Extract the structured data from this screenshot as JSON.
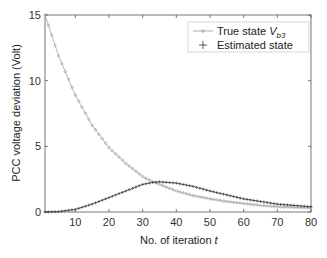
{
  "chart_data": {
    "type": "line",
    "title": "",
    "xlabel": "No. of iteration t",
    "ylabel": "PCC voltage deviation (Volt)",
    "xlim": [
      1,
      80
    ],
    "ylim": [
      0,
      15
    ],
    "xticks": [
      10,
      20,
      30,
      40,
      50,
      60,
      70,
      80
    ],
    "yticks": [
      0,
      5,
      10,
      15
    ],
    "grid": false,
    "legend_position": "upper right",
    "series": [
      {
        "name": "True state V_b3",
        "marker": "o",
        "color": "#9a9a9a",
        "x": [
          1,
          5,
          10,
          15,
          20,
          25,
          30,
          33,
          35,
          40,
          45,
          50,
          55,
          60,
          65,
          70,
          75,
          80
        ],
        "values": [
          15.0,
          11.9,
          8.9,
          6.6,
          4.9,
          3.7,
          2.7,
          2.3,
          2.1,
          1.6,
          1.25,
          1.0,
          0.8,
          0.65,
          0.5,
          0.4,
          0.35,
          0.3
        ]
      },
      {
        "name": "Estimated state",
        "marker": "+",
        "color": "#333333",
        "x": [
          1,
          5,
          10,
          15,
          20,
          25,
          30,
          33,
          35,
          40,
          45,
          50,
          55,
          60,
          65,
          70,
          75,
          80
        ],
        "values": [
          0.0,
          0.03,
          0.2,
          0.6,
          1.1,
          1.6,
          2.1,
          2.25,
          2.3,
          2.2,
          1.95,
          1.6,
          1.3,
          1.0,
          0.8,
          0.6,
          0.5,
          0.4
        ]
      }
    ]
  },
  "legend": {
    "true_label": "True  state ",
    "true_sub": "b3",
    "est_label": "Estimated state"
  },
  "axes": {
    "xlabel_prefix": "No. of iteration ",
    "xlabel_var": "t",
    "ylabel": "PCC voltage deviation (Volt)"
  }
}
